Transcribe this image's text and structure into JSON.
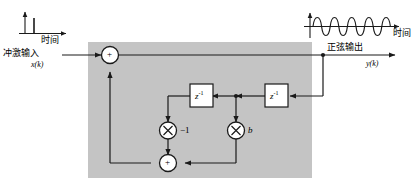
{
  "diagram": {
    "type": "signal-flow-block-diagram",
    "canvas": {
      "width": 420,
      "height": 190
    },
    "colors": {
      "block_fill": "#c4c4c4",
      "line": "#1a1a1a",
      "node_fill": "#ffffff",
      "page_background": "#ffffff"
    },
    "input": {
      "plot_label_time": "时间",
      "signal_name": "冲激输入",
      "variable": "x(k)",
      "waveform": "impulse",
      "impulse_count": 1
    },
    "output": {
      "plot_label_time": "时间",
      "signal_name": "正弦输出",
      "variable": "y(k)",
      "waveform": "sine",
      "cycles": 5
    },
    "nodes": {
      "sum_top": "+",
      "sum_bottom": "+",
      "delay_1": "z",
      "delay_1_exp": "-1",
      "delay_2": "z",
      "delay_2_exp": "-1",
      "mult_left": "×",
      "mult_left_gain": "−1",
      "mult_right": "×",
      "mult_right_gain": "b"
    }
  }
}
